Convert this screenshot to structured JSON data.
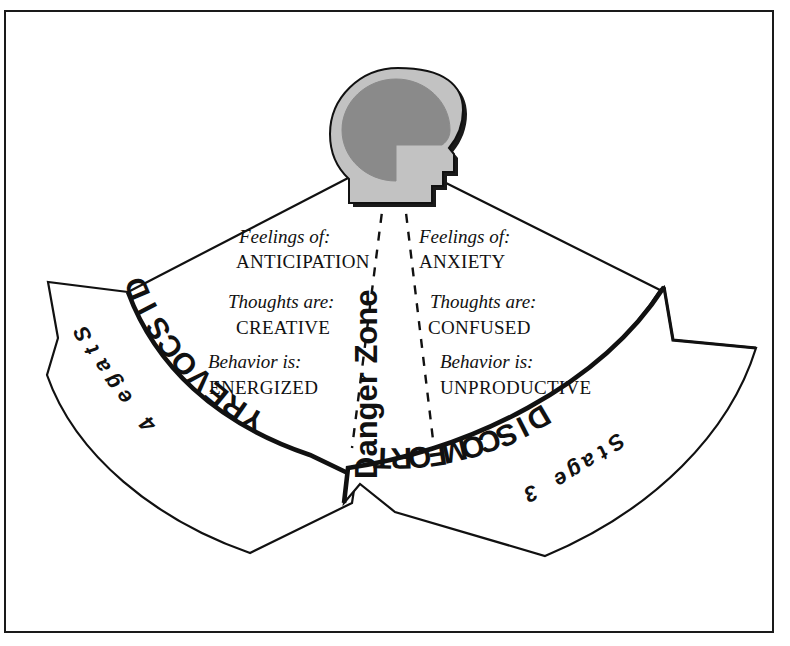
{
  "diagram": {
    "border_color": "#1a1a1a",
    "background": "#ffffff"
  },
  "head_icon": {
    "name": "head-profile-icon",
    "head_fill": "#c2c2c2",
    "brain_fill": "#8a8a8a",
    "outline": "#111111"
  },
  "center": {
    "danger_zone_label": "Danger Zone",
    "dash_color": "#111111"
  },
  "columns": {
    "left": {
      "side": "discovery",
      "rows": [
        {
          "label": "Feelings of:",
          "value": "ANTICIPATION"
        },
        {
          "label": "Thoughts are:",
          "value": "CREATIVE"
        },
        {
          "label": "Behavior is:",
          "value": "ENERGIZED"
        }
      ]
    },
    "right": {
      "side": "discomfort",
      "rows": [
        {
          "label": "Feelings of:",
          "value": "ANXIETY"
        },
        {
          "label": "Thoughts are:",
          "value": "CONFUSED"
        },
        {
          "label": "Behavior is:",
          "value": "UNPRODUCTIVE"
        }
      ]
    }
  },
  "banners": [
    {
      "id": "left-banner",
      "name": "DISCOVERY",
      "stage": "Stage 4",
      "direction": "left"
    },
    {
      "id": "right-banner",
      "name": "DISCOMFORT",
      "stage": "Stage 3",
      "direction": "right"
    }
  ]
}
